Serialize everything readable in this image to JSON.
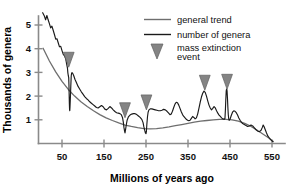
{
  "chart_data": {
    "type": "line",
    "title": "",
    "xlabel": "Millions of years ago",
    "ylabel": "Thousands of genera",
    "xlim": [
      0,
      560
    ],
    "ylim": [
      0,
      5.7
    ],
    "x_ticks": [
      50,
      150,
      250,
      350,
      450,
      550
    ],
    "y_ticks": [
      1,
      2,
      3,
      4,
      5
    ],
    "x_tick_labels": [
      "50",
      "150",
      "250",
      "350",
      "450",
      "550"
    ],
    "y_tick_labels": [
      "1",
      "2",
      "3",
      "4",
      "5"
    ],
    "x_axis_inverted": false,
    "grid": false,
    "legend_position": "top-right",
    "series": [
      {
        "name": "general trend",
        "color": "#6e6e6e",
        "points": [
          [
            5,
            4.02
          ],
          [
            20,
            3.48
          ],
          [
            35,
            3.02
          ],
          [
            50,
            2.62
          ],
          [
            65,
            2.28
          ],
          [
            80,
            2.0
          ],
          [
            95,
            1.76
          ],
          [
            110,
            1.56
          ],
          [
            125,
            1.38
          ],
          [
            140,
            1.22
          ],
          [
            155,
            1.08
          ],
          [
            170,
            0.97
          ],
          [
            185,
            0.87
          ],
          [
            200,
            0.78
          ],
          [
            215,
            0.72
          ],
          [
            230,
            0.67
          ],
          [
            245,
            0.63
          ],
          [
            260,
            0.62
          ],
          [
            275,
            0.63
          ],
          [
            290,
            0.66
          ],
          [
            305,
            0.7
          ],
          [
            320,
            0.75
          ],
          [
            335,
            0.8
          ],
          [
            350,
            0.85
          ],
          [
            365,
            0.9
          ],
          [
            380,
            0.94
          ],
          [
            395,
            0.97
          ],
          [
            410,
            1.0
          ],
          [
            425,
            1.02
          ],
          [
            440,
            1.02
          ],
          [
            455,
            1.0
          ],
          [
            470,
            0.94
          ],
          [
            485,
            0.85
          ],
          [
            500,
            0.72
          ],
          [
            515,
            0.56
          ],
          [
            530,
            0.38
          ],
          [
            545,
            0.2
          ],
          [
            553,
            0.08
          ]
        ]
      },
      {
        "name": "number of genera",
        "color": "#1a1a1a",
        "points": [
          [
            4,
            5.52
          ],
          [
            8,
            5.38
          ],
          [
            11,
            5.22
          ],
          [
            14,
            5.4
          ],
          [
            17,
            5.22
          ],
          [
            20,
            5.06
          ],
          [
            23,
            4.88
          ],
          [
            26,
            4.95
          ],
          [
            29,
            4.78
          ],
          [
            32,
            4.6
          ],
          [
            35,
            4.4
          ],
          [
            38,
            4.42
          ],
          [
            41,
            4.25
          ],
          [
            44,
            4.08
          ],
          [
            47,
            4.1
          ],
          [
            50,
            3.92
          ],
          [
            53,
            3.76
          ],
          [
            56,
            3.7
          ],
          [
            59,
            3.56
          ],
          [
            61,
            3.36
          ],
          [
            63,
            3.18
          ],
          [
            64,
            2.98
          ],
          [
            65,
            2.86
          ],
          [
            66,
            2.78
          ],
          [
            66.5,
            2.5
          ],
          [
            67,
            2.1
          ],
          [
            67.5,
            1.7
          ],
          [
            68,
            1.45
          ],
          [
            68.5,
            1.38
          ],
          [
            69,
            1.52
          ],
          [
            70,
            1.95
          ],
          [
            71,
            2.45
          ],
          [
            72,
            2.86
          ],
          [
            73,
            2.98
          ],
          [
            75,
            2.98
          ],
          [
            78,
            2.86
          ],
          [
            81,
            2.7
          ],
          [
            84,
            2.58
          ],
          [
            88,
            2.42
          ],
          [
            92,
            2.3
          ],
          [
            96,
            2.18
          ],
          [
            100,
            2.08
          ],
          [
            104,
            1.98
          ],
          [
            108,
            1.9
          ],
          [
            112,
            1.84
          ],
          [
            116,
            1.76
          ],
          [
            120,
            1.7
          ],
          [
            124,
            1.64
          ],
          [
            128,
            1.58
          ],
          [
            132,
            1.52
          ],
          [
            136,
            1.5
          ],
          [
            140,
            1.55
          ],
          [
            144,
            1.6
          ],
          [
            148,
            1.55
          ],
          [
            152,
            1.45
          ],
          [
            156,
            1.42
          ],
          [
            160,
            1.48
          ],
          [
            164,
            1.56
          ],
          [
            168,
            1.5
          ],
          [
            172,
            1.42
          ],
          [
            176,
            1.35
          ],
          [
            180,
            1.3
          ],
          [
            184,
            1.28
          ],
          [
            188,
            1.26
          ],
          [
            191,
            1.22
          ],
          [
            194,
            1.1
          ],
          [
            196,
            0.9
          ],
          [
            197.5,
            0.68
          ],
          [
            199,
            0.52
          ],
          [
            200,
            0.45
          ],
          [
            201,
            0.55
          ],
          [
            203,
            0.78
          ],
          [
            205,
            0.98
          ],
          [
            208,
            1.12
          ],
          [
            212,
            1.2
          ],
          [
            216,
            1.24
          ],
          [
            220,
            1.26
          ],
          [
            224,
            1.26
          ],
          [
            228,
            1.22
          ],
          [
            232,
            1.16
          ],
          [
            236,
            1.1
          ],
          [
            240,
            1.02
          ],
          [
            243,
            0.88
          ],
          [
            245,
            0.7
          ],
          [
            247,
            0.55
          ],
          [
            248.5,
            0.45
          ],
          [
            250,
            0.42
          ],
          [
            251,
            0.52
          ],
          [
            252,
            0.8
          ],
          [
            253.5,
            1.12
          ],
          [
            255,
            1.32
          ],
          [
            257,
            1.42
          ],
          [
            260,
            1.46
          ],
          [
            264,
            1.46
          ],
          [
            268,
            1.44
          ],
          [
            272,
            1.42
          ],
          [
            276,
            1.4
          ],
          [
            280,
            1.38
          ],
          [
            284,
            1.38
          ],
          [
            288,
            1.4
          ],
          [
            292,
            1.44
          ],
          [
            296,
            1.42
          ],
          [
            300,
            1.36
          ],
          [
            304,
            1.28
          ],
          [
            307,
            1.22
          ],
          [
            310,
            1.24
          ],
          [
            313,
            1.36
          ],
          [
            316,
            1.52
          ],
          [
            319,
            1.66
          ],
          [
            322,
            1.74
          ],
          [
            325,
            1.72
          ],
          [
            328,
            1.62
          ],
          [
            331,
            1.48
          ],
          [
            334,
            1.34
          ],
          [
            337,
            1.22
          ],
          [
            340,
            1.14
          ],
          [
            343,
            1.08
          ],
          [
            346,
            1.02
          ],
          [
            349,
            0.98
          ],
          [
            352,
            0.96
          ],
          [
            355,
            0.98
          ],
          [
            358,
            1.06
          ],
          [
            361,
            1.14
          ],
          [
            364,
            1.1
          ],
          [
            367,
            1.04
          ],
          [
            370,
            1.08
          ],
          [
            373,
            1.24
          ],
          [
            376,
            1.48
          ],
          [
            379,
            1.74
          ],
          [
            382,
            1.96
          ],
          [
            385,
            2.12
          ],
          [
            388,
            2.21
          ],
          [
            391,
            2.16
          ],
          [
            394,
            2.0
          ],
          [
            397,
            1.8
          ],
          [
            400,
            1.62
          ],
          [
            403,
            1.5
          ],
          [
            406,
            1.42
          ],
          [
            409,
            1.48
          ],
          [
            412,
            1.56
          ],
          [
            415,
            1.5
          ],
          [
            418,
            1.38
          ],
          [
            421,
            1.28
          ],
          [
            424,
            1.2
          ],
          [
            427,
            1.14
          ],
          [
            430,
            1.08
          ],
          [
            433,
            1.04
          ],
          [
            436,
            1.02
          ],
          [
            438,
            1.06
          ],
          [
            439,
            1.4
          ],
          [
            440,
            1.85
          ],
          [
            441,
            2.22
          ],
          [
            442,
            2.3
          ],
          [
            443,
            2.22
          ],
          [
            444,
            1.9
          ],
          [
            445,
            1.5
          ],
          [
            446,
            1.2
          ],
          [
            447,
            1.04
          ],
          [
            448,
            0.98
          ],
          [
            450,
            1.02
          ],
          [
            453,
            1.18
          ],
          [
            456,
            1.32
          ],
          [
            459,
            1.38
          ],
          [
            462,
            1.36
          ],
          [
            465,
            1.3
          ],
          [
            468,
            1.2
          ],
          [
            471,
            1.08
          ],
          [
            474,
            0.98
          ],
          [
            477,
            0.9
          ],
          [
            480,
            0.84
          ],
          [
            484,
            0.8
          ],
          [
            488,
            0.76
          ],
          [
            492,
            0.72
          ],
          [
            496,
            0.74
          ],
          [
            500,
            0.78
          ],
          [
            504,
            0.74
          ],
          [
            508,
            0.66
          ],
          [
            512,
            0.58
          ],
          [
            516,
            0.52
          ],
          [
            520,
            0.5
          ],
          [
            524,
            0.56
          ],
          [
            527,
            0.68
          ],
          [
            529,
            0.78
          ],
          [
            531,
            0.72
          ],
          [
            534,
            0.58
          ],
          [
            537,
            0.44
          ],
          [
            540,
            0.32
          ],
          [
            544,
            0.22
          ],
          [
            548,
            0.14
          ],
          [
            552,
            0.08
          ]
        ]
      }
    ],
    "markers": {
      "name": "mass extinction event",
      "color": "#848484",
      "events": [
        {
          "x": 66,
          "y_top": 3.85
        },
        {
          "x": 200,
          "y_top": 1.72
        },
        {
          "x": 251,
          "y_top": 2.05
        },
        {
          "x": 390,
          "y_top": 2.88
        },
        {
          "x": 443,
          "y_top": 2.92
        }
      ]
    },
    "legend": [
      {
        "label": "general trend",
        "type": "line",
        "color": "#6e6e6e"
      },
      {
        "label": "number of genera",
        "type": "line",
        "color": "#1a1a1a"
      },
      {
        "label": "mass extinction event",
        "type": "triangle",
        "color": "#848484"
      }
    ]
  }
}
